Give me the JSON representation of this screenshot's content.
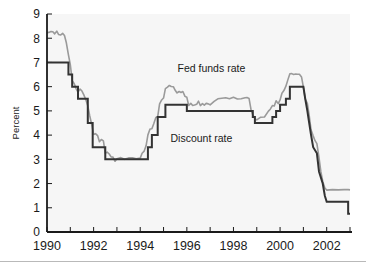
{
  "chart_data": {
    "type": "line",
    "title": "",
    "xlabel": "",
    "ylabel": "Percent",
    "xlim": [
      1990.0,
      2003.0
    ],
    "ylim": [
      0,
      9
    ],
    "grid": false,
    "legend_position": "inline-annotation",
    "y_ticks": [
      "0",
      "1",
      "2",
      "3",
      "4",
      "5",
      "6",
      "7",
      "8",
      "9"
    ],
    "y_tick_values": [
      0,
      1,
      2,
      3,
      4,
      5,
      6,
      7,
      8,
      9
    ],
    "x_ticks": [
      "1990",
      "1992",
      "1994",
      "1996",
      "1998",
      "2000",
      "2002"
    ],
    "x_tick_values": [
      1990,
      1992,
      1994,
      1996,
      1998,
      2000,
      2002
    ],
    "x_minor_tick_values": [
      1991,
      1993,
      1995,
      1997,
      1999,
      2001,
      2003
    ],
    "annotations": [
      {
        "name": "fed-funds-rate",
        "text": "Fed funds rate",
        "x": 1995.6,
        "y": 6.62
      },
      {
        "name": "discount-rate",
        "text": "Discount rate",
        "x": 1995.3,
        "y": 3.72
      }
    ],
    "series": [
      {
        "name": "Fed funds rate",
        "color": "#9a9a9a",
        "linewidth": 1.6,
        "points": [
          [
            1990.0,
            8.23
          ],
          [
            1990.08,
            8.24
          ],
          [
            1990.17,
            8.28
          ],
          [
            1990.25,
            8.27
          ],
          [
            1990.33,
            8.18
          ],
          [
            1990.42,
            8.29
          ],
          [
            1990.5,
            8.15
          ],
          [
            1990.58,
            8.13
          ],
          [
            1990.67,
            8.2
          ],
          [
            1990.75,
            8.11
          ],
          [
            1990.83,
            7.81
          ],
          [
            1990.92,
            7.31
          ],
          [
            1991.0,
            6.91
          ],
          [
            1991.08,
            6.25
          ],
          [
            1991.17,
            6.12
          ],
          [
            1991.25,
            5.91
          ],
          [
            1991.33,
            5.78
          ],
          [
            1991.42,
            5.9
          ],
          [
            1991.5,
            5.82
          ],
          [
            1991.58,
            5.66
          ],
          [
            1991.67,
            5.45
          ],
          [
            1991.75,
            5.21
          ],
          [
            1991.83,
            4.81
          ],
          [
            1991.92,
            4.43
          ],
          [
            1992.0,
            4.03
          ],
          [
            1992.08,
            4.06
          ],
          [
            1992.17,
            3.98
          ],
          [
            1992.25,
            3.73
          ],
          [
            1992.33,
            3.82
          ],
          [
            1992.42,
            3.76
          ],
          [
            1992.5,
            3.25
          ],
          [
            1992.58,
            3.3
          ],
          [
            1992.67,
            3.22
          ],
          [
            1992.75,
            3.1
          ],
          [
            1992.83,
            3.09
          ],
          [
            1992.92,
            2.92
          ],
          [
            1993.0,
            3.02
          ],
          [
            1993.17,
            3.07
          ],
          [
            1993.33,
            3.0
          ],
          [
            1993.5,
            3.06
          ],
          [
            1993.67,
            3.06
          ],
          [
            1993.83,
            3.02
          ],
          [
            1994.0,
            3.05
          ],
          [
            1994.08,
            3.25
          ],
          [
            1994.17,
            3.34
          ],
          [
            1994.25,
            3.56
          ],
          [
            1994.33,
            4.01
          ],
          [
            1994.42,
            4.25
          ],
          [
            1994.5,
            4.26
          ],
          [
            1994.58,
            4.47
          ],
          [
            1994.67,
            4.73
          ],
          [
            1994.75,
            4.76
          ],
          [
            1994.83,
            5.29
          ],
          [
            1994.92,
            5.45
          ],
          [
            1995.0,
            5.53
          ],
          [
            1995.08,
            5.92
          ],
          [
            1995.17,
            5.98
          ],
          [
            1995.25,
            6.05
          ],
          [
            1995.33,
            6.01
          ],
          [
            1995.42,
            6.0
          ],
          [
            1995.5,
            5.85
          ],
          [
            1995.58,
            5.74
          ],
          [
            1995.67,
            5.8
          ],
          [
            1995.75,
            5.76
          ],
          [
            1995.83,
            5.8
          ],
          [
            1995.92,
            5.6
          ],
          [
            1996.0,
            5.56
          ],
          [
            1996.08,
            5.22
          ],
          [
            1996.17,
            5.31
          ],
          [
            1996.25,
            5.22
          ],
          [
            1996.33,
            5.24
          ],
          [
            1996.42,
            5.27
          ],
          [
            1996.5,
            5.4
          ],
          [
            1996.58,
            5.22
          ],
          [
            1996.67,
            5.3
          ],
          [
            1996.75,
            5.24
          ],
          [
            1996.83,
            5.31
          ],
          [
            1996.92,
            5.29
          ],
          [
            1997.0,
            5.25
          ],
          [
            1997.17,
            5.39
          ],
          [
            1997.33,
            5.5
          ],
          [
            1997.5,
            5.52
          ],
          [
            1997.67,
            5.54
          ],
          [
            1997.83,
            5.5
          ],
          [
            1998.0,
            5.56
          ],
          [
            1998.17,
            5.49
          ],
          [
            1998.33,
            5.5
          ],
          [
            1998.5,
            5.54
          ],
          [
            1998.58,
            5.55
          ],
          [
            1998.67,
            5.51
          ],
          [
            1998.75,
            5.07
          ],
          [
            1998.83,
            4.83
          ],
          [
            1998.92,
            4.68
          ],
          [
            1999.0,
            4.63
          ],
          [
            1999.17,
            4.74
          ],
          [
            1999.33,
            4.75
          ],
          [
            1999.5,
            4.99
          ],
          [
            1999.58,
            5.07
          ],
          [
            1999.67,
            5.22
          ],
          [
            1999.75,
            5.2
          ],
          [
            1999.83,
            5.42
          ],
          [
            1999.92,
            5.3
          ],
          [
            2000.0,
            5.45
          ],
          [
            2000.08,
            5.73
          ],
          [
            2000.17,
            5.85
          ],
          [
            2000.25,
            6.02
          ],
          [
            2000.33,
            6.27
          ],
          [
            2000.42,
            6.53
          ],
          [
            2000.5,
            6.54
          ],
          [
            2000.58,
            6.5
          ],
          [
            2000.67,
            6.52
          ],
          [
            2000.75,
            6.51
          ],
          [
            2000.83,
            6.51
          ],
          [
            2000.92,
            6.4
          ],
          [
            2001.0,
            5.98
          ],
          [
            2001.08,
            5.49
          ],
          [
            2001.17,
            5.31
          ],
          [
            2001.25,
            4.8
          ],
          [
            2001.33,
            4.21
          ],
          [
            2001.42,
            3.97
          ],
          [
            2001.5,
            3.77
          ],
          [
            2001.58,
            3.65
          ],
          [
            2001.67,
            3.07
          ],
          [
            2001.75,
            2.49
          ],
          [
            2001.83,
            2.09
          ],
          [
            2001.92,
            1.82
          ],
          [
            2002.0,
            1.73
          ],
          [
            2002.25,
            1.75
          ],
          [
            2002.5,
            1.74
          ],
          [
            2002.75,
            1.75
          ],
          [
            2002.92,
            1.75
          ],
          [
            2003.0,
            1.74
          ]
        ]
      },
      {
        "name": "Discount rate",
        "color": "#333333",
        "linewidth": 2.0,
        "points": [
          [
            1990.0,
            7.0
          ],
          [
            1990.92,
            7.0
          ],
          [
            1990.92,
            6.5
          ],
          [
            1991.08,
            6.5
          ],
          [
            1991.08,
            6.0
          ],
          [
            1991.33,
            6.0
          ],
          [
            1991.33,
            5.5
          ],
          [
            1991.75,
            5.5
          ],
          [
            1991.75,
            4.5
          ],
          [
            1991.96,
            4.5
          ],
          [
            1991.96,
            3.5
          ],
          [
            1992.5,
            3.5
          ],
          [
            1992.5,
            3.0
          ],
          [
            1994.33,
            3.0
          ],
          [
            1994.33,
            3.5
          ],
          [
            1994.5,
            3.5
          ],
          [
            1994.5,
            4.0
          ],
          [
            1994.75,
            4.0
          ],
          [
            1994.75,
            4.75
          ],
          [
            1995.08,
            4.75
          ],
          [
            1995.08,
            5.25
          ],
          [
            1996.0,
            5.25
          ],
          [
            1996.0,
            5.0
          ],
          [
            1998.83,
            5.0
          ],
          [
            1998.83,
            4.75
          ],
          [
            1998.92,
            4.75
          ],
          [
            1998.92,
            4.5
          ],
          [
            1999.67,
            4.5
          ],
          [
            1999.67,
            4.75
          ],
          [
            1999.83,
            4.75
          ],
          [
            1999.83,
            5.0
          ],
          [
            2000.0,
            5.0
          ],
          [
            2000.0,
            5.25
          ],
          [
            2000.25,
            5.25
          ],
          [
            2000.25,
            5.5
          ],
          [
            2000.42,
            5.5
          ],
          [
            2000.42,
            6.0
          ],
          [
            2001.0,
            6.0
          ],
          [
            2001.08,
            5.5
          ],
          [
            2001.17,
            5.0
          ],
          [
            2001.25,
            4.5
          ],
          [
            2001.33,
            4.0
          ],
          [
            2001.42,
            3.5
          ],
          [
            2001.58,
            3.25
          ],
          [
            2001.67,
            2.5
          ],
          [
            2001.83,
            2.0
          ],
          [
            2001.92,
            1.5
          ],
          [
            2002.0,
            1.25
          ],
          [
            2002.92,
            1.25
          ],
          [
            2002.92,
            0.75
          ],
          [
            2003.0,
            0.75
          ]
        ]
      }
    ]
  },
  "layout": {
    "plot_left": 47,
    "plot_right": 350,
    "plot_top": 14,
    "plot_bottom": 232
  }
}
